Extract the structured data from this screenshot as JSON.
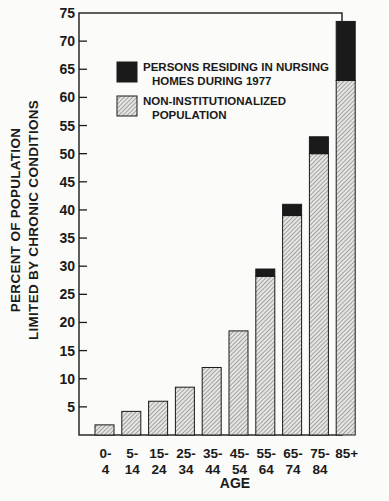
{
  "chart_data": {
    "type": "bar",
    "stacked": true,
    "title": "",
    "xlabel": "AGE",
    "ylabel": [
      "PERCENT OF POPULATION",
      "LIMITED BY CHRONIC CONDITIONS"
    ],
    "ylim": [
      0,
      75
    ],
    "yticks": [
      5,
      10,
      15,
      20,
      25,
      30,
      35,
      40,
      45,
      50,
      55,
      60,
      65,
      70,
      75
    ],
    "categories": [
      [
        "0-",
        "4"
      ],
      [
        "5-",
        "14"
      ],
      [
        "15-",
        "24"
      ],
      [
        "25-",
        "34"
      ],
      [
        "35-",
        "44"
      ],
      [
        "45-",
        "54"
      ],
      [
        "55-",
        "64"
      ],
      [
        "65-",
        "74"
      ],
      [
        "75-",
        "84"
      ],
      [
        "85+",
        ""
      ]
    ],
    "series": [
      {
        "name": "NON-INSTITUTIONALIZED POPULATION",
        "pattern": "hatched",
        "values": [
          1.8,
          4.2,
          6.0,
          8.5,
          12.0,
          18.5,
          28.2,
          39.0,
          50.0,
          63.0
        ]
      },
      {
        "name": "PERSONS RESIDING IN NURSING HOMES DURING 1977",
        "pattern": "solid-black",
        "values": [
          0,
          0,
          0,
          0,
          0,
          0,
          1.3,
          2.0,
          3.0,
          10.5
        ]
      }
    ],
    "legend": {
      "position": "upper-left-inside",
      "entries": [
        {
          "lines": [
            "PERSONS RESIDING IN NURSING",
            "HOMES DURING 1977"
          ],
          "swatch": "solid-black"
        },
        {
          "lines": [
            "NON-INSTITUTIONALIZED",
            "POPULATION"
          ],
          "swatch": "hatched"
        }
      ]
    },
    "grid": false
  },
  "colors": {
    "ink": "#1a1a1a",
    "paper": "#fbfbf9",
    "hatch_bg": "#e6e6e2",
    "hatch_line": "#6a6a6a"
  }
}
